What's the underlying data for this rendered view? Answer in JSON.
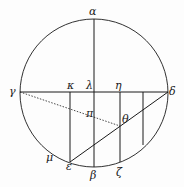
{
  "diagram": {
    "type": "geometric-construction",
    "stroke_color": "#1a1a1a",
    "background": "#fdfdfd",
    "circle": {
      "cx": 94,
      "cy": 93,
      "r": 74
    },
    "labels": {
      "alpha": "α",
      "beta": "β",
      "gamma": "γ",
      "delta": "δ",
      "epsilon": "ε",
      "zeta": "ζ",
      "eta": "η",
      "theta": "θ",
      "kappa": "κ",
      "lambda": "λ",
      "mu": "μ",
      "pi": "π"
    }
  }
}
